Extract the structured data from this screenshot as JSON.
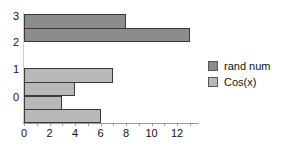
{
  "chart_data": {
    "type": "bar",
    "orientation": "horizontal",
    "title": "",
    "xlabel": "",
    "ylabel": "",
    "xlim": [
      0,
      13.5
    ],
    "x_ticks": [
      "0",
      "2",
      "4",
      "6",
      "8",
      "10",
      "12"
    ],
    "y_ticks": [
      "0",
      "1",
      "2",
      "3"
    ],
    "grid": false,
    "legend_position": "right",
    "series": [
      {
        "name": "rand num",
        "color": "#8c8c8c",
        "bars": [
          {
            "y_center": 2.5,
            "values": [
              8,
              13
            ]
          }
        ]
      },
      {
        "name": "Cos(x)",
        "color": "#b8b8b8",
        "bars": [
          {
            "y_center": 0,
            "values": [
              7,
              4,
              3,
              6
            ]
          }
        ]
      }
    ],
    "bars_top_to_bottom": [
      {
        "series": "rand num",
        "value": 8
      },
      {
        "series": "rand num",
        "value": 13
      },
      {
        "series": "Cos(x)",
        "value": 7
      },
      {
        "series": "Cos(x)",
        "value": 4
      },
      {
        "series": "Cos(x)",
        "value": 3
      },
      {
        "series": "Cos(x)",
        "value": 6
      }
    ]
  },
  "legend": {
    "items": [
      {
        "label": "rand num",
        "color": "#8c8c8c"
      },
      {
        "label": "Cos(x)",
        "color": "#b8b8b8"
      }
    ]
  }
}
